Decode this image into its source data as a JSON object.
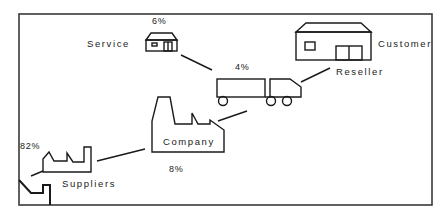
{
  "diagram": {
    "type": "supply-chain",
    "nodes": [
      {
        "id": "service",
        "label": "Service",
        "percent": "6%",
        "icon": "small-house-icon"
      },
      {
        "id": "reseller",
        "label": "Reseller",
        "percent": "4%",
        "icon": "truck-icon"
      },
      {
        "id": "customer",
        "label": "Customer",
        "percent": "",
        "icon": "building-icon"
      },
      {
        "id": "company",
        "label": "Company",
        "percent": "8%",
        "icon": "factory-icon"
      },
      {
        "id": "suppliers",
        "label": "Suppliers",
        "percent": "82%",
        "icon": "small-factory-icon"
      }
    ],
    "edges": [
      {
        "from": "service",
        "to": "reseller"
      },
      {
        "from": "reseller",
        "to": "customer"
      },
      {
        "from": "company",
        "to": "reseller"
      },
      {
        "from": "suppliers",
        "to": "company"
      },
      {
        "from": "raw-material",
        "to": "suppliers"
      }
    ],
    "colors": {
      "line": "#1a1a1a",
      "frame": "#3a3a3a",
      "background": "#ffffff"
    }
  }
}
